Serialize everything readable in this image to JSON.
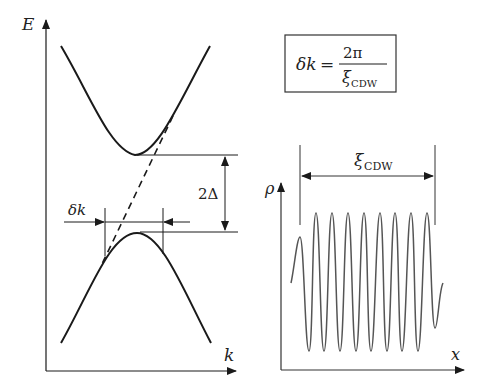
{
  "band_diagram": {
    "y_axis_label": "E",
    "x_axis_label": "k",
    "gap_label": "2Δ",
    "delta_k_label": "δk"
  },
  "formula": {
    "lhs": "δk",
    "equals": "=",
    "numerator": "2π",
    "denominator_symbol": "ξ",
    "denominator_subscript": "CDW"
  },
  "density_wave": {
    "y_axis_label": "ρ",
    "x_axis_label": "x",
    "period_symbol": "ξ",
    "period_subscript": "CDW",
    "full_oscillations": 8
  },
  "colors": {
    "line": "#1a1a1a",
    "wave": "#555555"
  }
}
